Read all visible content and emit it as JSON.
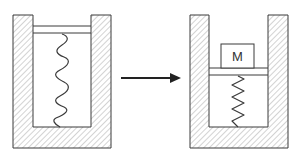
{
  "diagram": {
    "colors": {
      "stroke": "#3a3a3a",
      "hatch": "#9a9a9a",
      "background": "#ffffff"
    },
    "left_panel": {
      "state": "uncompressed",
      "spring_coils": 4
    },
    "arrow": {
      "direction": "right"
    },
    "right_panel": {
      "state": "compressed",
      "spring_coils": 8,
      "mass_label": "M"
    }
  }
}
